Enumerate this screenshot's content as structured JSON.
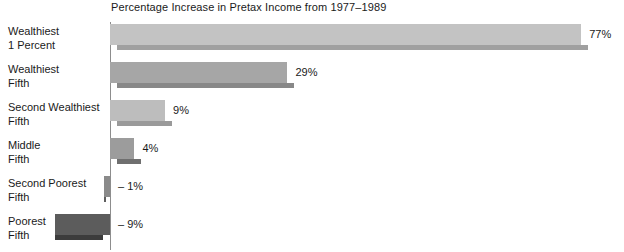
{
  "chart_data": {
    "type": "bar",
    "orientation": "horizontal",
    "title": "Percentage Increase in Pretax Income from 1977–1989",
    "xlabel": "",
    "ylabel": "",
    "grid": false,
    "legend": "none",
    "xlim": [
      -12,
      80
    ],
    "zero_axis": true,
    "categories": [
      "Wealthiest 1 Percent",
      "Wealthiest Fifth",
      "Second Wealthiest Fifth",
      "Middle Fifth",
      "Second Poorest Fifth",
      "Poorest Fifth"
    ],
    "values": [
      77,
      29,
      9,
      4,
      -1,
      -9
    ],
    "value_labels": [
      "77%",
      "29%",
      "9%",
      "4%",
      "– 1%",
      "– 9%"
    ],
    "bars": [
      {
        "category_line1": "Wealthiest",
        "category_line2": "1 Percent",
        "value": 77,
        "label": "77%",
        "fill": "#c3c3c3",
        "shadow": "#a0a0a0"
      },
      {
        "category_line1": "Wealthiest",
        "category_line2": "Fifth",
        "value": 29,
        "label": "29%",
        "fill": "#a6a6a6",
        "shadow": "#888888"
      },
      {
        "category_line1": "Second Wealthiest",
        "category_line2": "Fifth",
        "value": 9,
        "label": "9%",
        "fill": "#bdbdbd",
        "shadow": "#9a9a9a"
      },
      {
        "category_line1": "Middle",
        "category_line2": "Fifth",
        "value": 4,
        "label": "4%",
        "fill": "#9c9c9c",
        "shadow": "#6f6f6f"
      },
      {
        "category_line1": "Second Poorest",
        "category_line2": "Fifth",
        "value": -1,
        "label": "– 1%",
        "fill": "#8a8a8a",
        "shadow": "#5e5e5e"
      },
      {
        "category_line1": "Poorest",
        "category_line2": "Fifth",
        "value": -9,
        "label": "– 9%",
        "fill": "#5c5c5c",
        "shadow": "#3c3c3c"
      }
    ]
  },
  "colors": {
    "background": "#ffffff",
    "axis": "#8d8d8d",
    "text": "#1a1a1a"
  }
}
